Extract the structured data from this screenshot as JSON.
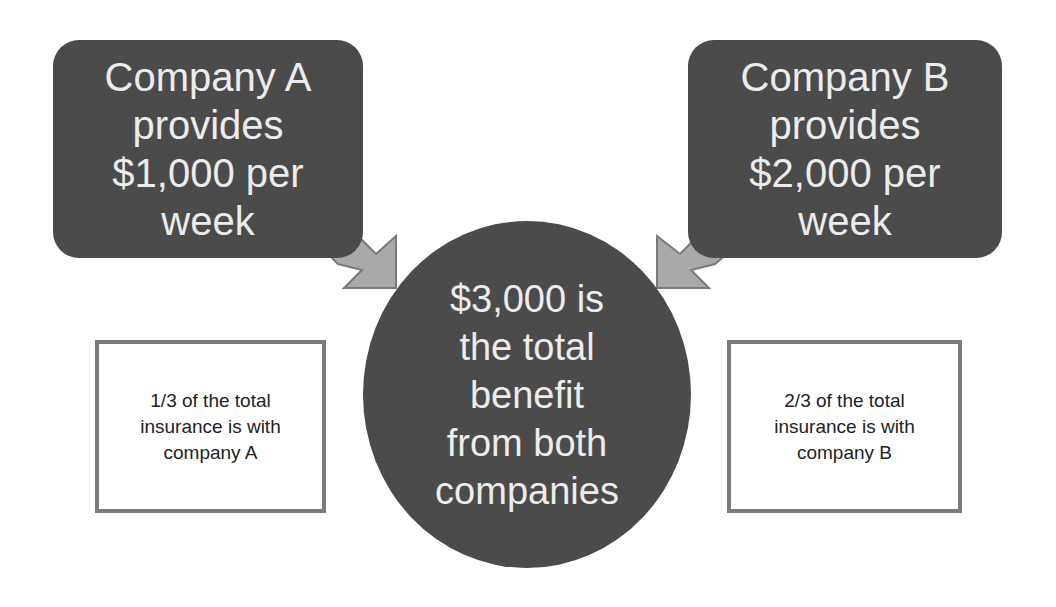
{
  "diagram": {
    "company_a": {
      "lines": [
        "Company A",
        "provides",
        "$1,000 per",
        "week"
      ],
      "amount": "$1,000",
      "period": "per week"
    },
    "company_b": {
      "lines": [
        "Company B",
        "provides",
        "$2,000 per",
        "week"
      ],
      "amount": "$2,000",
      "period": "per week"
    },
    "total": {
      "lines": [
        "$3,000 is",
        "the total",
        "benefit",
        "from both",
        "companies"
      ],
      "amount": "$3,000"
    },
    "note_a": {
      "lines": [
        "1/3 of the total",
        "insurance is with",
        "company A"
      ],
      "fraction": "1/3"
    },
    "note_b": {
      "lines": [
        "2/3 of the total",
        "insurance is with",
        "company B"
      ],
      "fraction": "2/3"
    },
    "arrows": [
      {
        "from": "company_a",
        "to": "total",
        "icon": "arrow-down-right-icon"
      },
      {
        "from": "company_b",
        "to": "total",
        "icon": "arrow-down-left-icon"
      }
    ],
    "colors": {
      "shape_fill": "#4b4b4b",
      "shape_text": "#ececec",
      "arrow_fill": "#a9a9a9",
      "arrow_stroke": "#7a7a7a",
      "note_border": "#7a7a7a",
      "note_text": "#222222"
    }
  }
}
